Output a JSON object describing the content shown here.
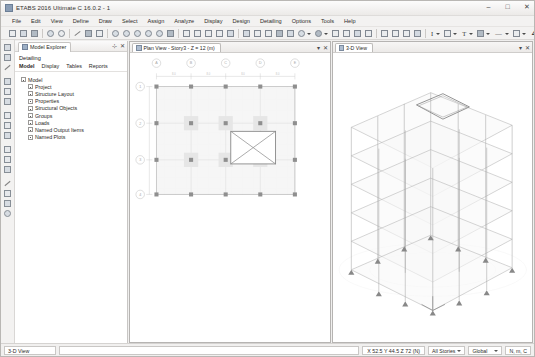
{
  "window": {
    "title": "ETABS 2016 Ultimate C 16.0.2 - 1",
    "app_icon": "etabs-icon",
    "minimize": "–",
    "maximize": "□",
    "close": "✕"
  },
  "menubar": {
    "items": [
      {
        "label": "File"
      },
      {
        "label": "Edit"
      },
      {
        "label": "View"
      },
      {
        "label": "Define"
      },
      {
        "label": "Draw"
      },
      {
        "label": "Select"
      },
      {
        "label": "Assign"
      },
      {
        "label": "Analyze"
      },
      {
        "label": "Display"
      },
      {
        "label": "Design"
      },
      {
        "label": "Detailing"
      },
      {
        "label": "Options"
      },
      {
        "label": "Tools"
      },
      {
        "label": "Help"
      }
    ]
  },
  "toolbar": {
    "icons": [
      "new-model-icon",
      "open-model-icon",
      "save-model-icon",
      "undo-icon",
      "redo-icon",
      "print-icon",
      "lock-icon",
      "run-analysis-icon",
      "zoom-in-icon",
      "zoom-out-icon",
      "zoom-previous-icon",
      "zoom-extents-icon",
      "zoom-window-icon",
      "pan-icon",
      "rubber-band-zoom-icon",
      "plan-view-icon",
      "elevation-view-icon",
      "3d-view-icon",
      "set-display-options-icon",
      "object-assigns-icon",
      "set-building-view-icon",
      "refresh-view-icon",
      "perspective-toggle-icon",
      "show-undeformed-shape-icon",
      "section-cut-icon",
      "measure-icon",
      "snap-icon"
    ],
    "text_icons": [
      "I",
      "T",
      "⊞",
      "—",
      "□",
      "∠"
    ]
  },
  "left_toolbar": {
    "icons": [
      "pointer-select-icon",
      "reshape-icon",
      "draw-line-icon",
      "draw-beam-icon",
      "draw-column-icon",
      "draw-brace-icon",
      "draw-floor-icon",
      "draw-wall-icon",
      "draw-rect-floor-icon",
      "draw-rect-wall-icon",
      "quick-draw-beam-icon",
      "quick-draw-column-icon",
      "quick-draw-floor-icon",
      "draw-dimension-icon",
      "draw-grid-icon",
      "draw-point-object-icon",
      "snap-options-icon"
    ]
  },
  "explorer": {
    "tab_label": "Model Explorer",
    "tab_icon": "explorer-icon",
    "pin_button": "⊹",
    "close_button": "✕",
    "section_title": "Detailing",
    "subtabs": [
      {
        "label": "Model",
        "active": true
      },
      {
        "label": "Display",
        "active": false
      },
      {
        "label": "Tables",
        "active": false
      },
      {
        "label": "Reports",
        "active": false
      }
    ],
    "tree": {
      "root": {
        "label": "Model",
        "icon": "model-folder-icon"
      },
      "children": [
        {
          "label": "Project",
          "icon": "project-icon"
        },
        {
          "label": "Structure Layout",
          "icon": "structure-layout-icon"
        },
        {
          "label": "Properties",
          "icon": "properties-icon"
        },
        {
          "label": "Structural Objects",
          "icon": "structural-objects-icon"
        },
        {
          "label": "Groups",
          "icon": "groups-icon"
        },
        {
          "label": "Loads",
          "icon": "loads-icon"
        },
        {
          "label": "Named Output Items",
          "icon": "named-output-items-icon"
        },
        {
          "label": "Named Plots",
          "icon": "named-plots-icon"
        }
      ]
    }
  },
  "views": {
    "plan": {
      "tab_label": "Plan View - Story3 - Z = 12 (m)",
      "tab_icon": "plan-view-icon",
      "restore_button": "▾",
      "close_button": "✕",
      "grid_labels_top": [
        "A",
        "B",
        "C",
        "D",
        "E"
      ],
      "grid_labels_left": [
        "1",
        "2",
        "3",
        "4"
      ],
      "opening_marker": "slab-opening-cross"
    },
    "view3d": {
      "tab_label": "3-D View",
      "tab_icon": "3d-view-icon",
      "restore_button": "▾",
      "close_button": "✕",
      "stories": 6,
      "roof_opening": "roof-opening-outline"
    }
  },
  "statusbar": {
    "view_name": "3-D View",
    "message": "",
    "coordinates": "X 52.5 Y 44.5 Z 72 (N)",
    "story_selector": "All Stories",
    "coordinate_system": "Global",
    "units": "N, m, C"
  }
}
